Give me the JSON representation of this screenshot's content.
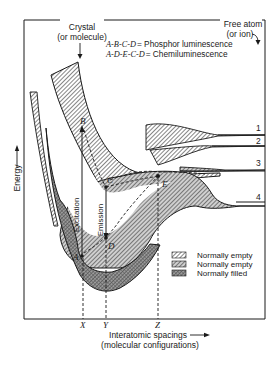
{
  "figure": {
    "top_labels": {
      "crystal_line1": "Crystal",
      "crystal_line2": "(or molecule)",
      "free_atom_line1": "Free atom",
      "free_atom_line2": "(or ion)"
    },
    "equations": [
      {
        "path": "A-B-C-D",
        "meaning": "= Phosphor  luminescence"
      },
      {
        "path": "A-D-E-C-D",
        "meaning": "= Chemiluminescence"
      }
    ],
    "y_axis_label": "Energy",
    "x_axis_label_line1": "Interatomic spacings",
    "x_axis_label_line2": "(molecular configurations)",
    "level_numbers": [
      "1",
      "2",
      "3",
      "4"
    ],
    "points": [
      "A",
      "B",
      "C",
      "D",
      "E"
    ],
    "transitions": {
      "excitation": "Excitation",
      "emission": "Emission"
    },
    "x_markers": [
      "X",
      "Y",
      "Z"
    ],
    "legend": [
      {
        "label": "Normally empty",
        "pattern": "light-hatch"
      },
      {
        "label": "Normally empty",
        "pattern": "medium-hatch"
      },
      {
        "label": "Normally filled",
        "pattern": "dense-hatch"
      }
    ],
    "colors": {
      "ink": "#1a1a1a",
      "hatch": "#555555",
      "background": "#ffffff"
    }
  }
}
